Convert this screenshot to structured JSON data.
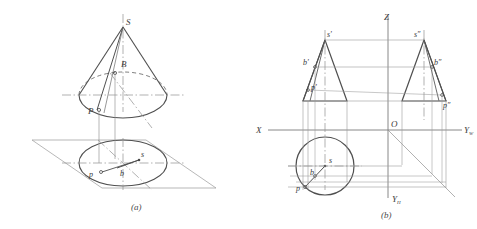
{
  "figure": {
    "colors": {
      "background": "#ffffff",
      "outline": "#5a5a5a",
      "thin_line": "#8f8f8f",
      "center_line": "#9a9a9a",
      "hidden_line": "#7a7a7a",
      "label": "#3a3a3a"
    }
  },
  "fig_a": {
    "caption": "(a)",
    "labels": {
      "apex": "S",
      "point_b_space": "B",
      "point_p_space": "P",
      "base_p": "p",
      "base_b": "b",
      "base_s": "s"
    }
  },
  "fig_b": {
    "caption": "(b)",
    "axes": {
      "x": "X",
      "z": "Z",
      "origin": "O",
      "y_w": "Y",
      "y_w_sub": "W",
      "y_h": "Y",
      "y_h_sub": "H"
    },
    "front_view": {
      "apex": "s'",
      "b": "b'",
      "p": "p'"
    },
    "side_view": {
      "apex": "s″",
      "b": "b″",
      "p": "p″"
    },
    "top_view": {
      "s": "s",
      "b": "b",
      "p": "p"
    }
  }
}
